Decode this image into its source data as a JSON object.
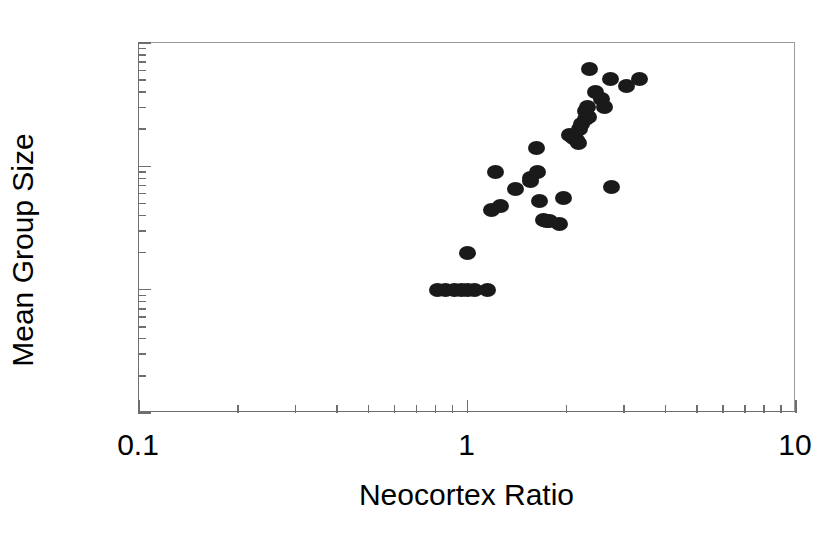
{
  "chart_data": {
    "type": "scatter",
    "title": "",
    "xlabel": "Neocortex Ratio",
    "ylabel": "Mean Group Size",
    "xscale": "log",
    "yscale": "log",
    "xlim": [
      0.1,
      10
    ],
    "ylim": [
      0.1,
      100
    ],
    "grid": false,
    "legend": null,
    "marker": {
      "shape": "circle",
      "color": "#1a1a1a",
      "filled": true
    },
    "xticks": [
      0.1,
      1,
      10
    ],
    "xtick_labels": [
      "0.1",
      "1",
      "10"
    ],
    "yticks": [
      0.1,
      1,
      10,
      100
    ],
    "ytick_labels": [
      "0.1",
      "1",
      "10",
      "100"
    ],
    "x": [
      0.81,
      0.86,
      0.91,
      0.96,
      1.0,
      1.05,
      1.15,
      1.0,
      1.22,
      1.26,
      1.18,
      1.4,
      1.55,
      1.66,
      1.7,
      1.74,
      1.78,
      1.9,
      1.56,
      1.62,
      1.96,
      1.63,
      2.1,
      2.14,
      2.18,
      2.2,
      2.22,
      2.05,
      2.28,
      2.34,
      2.28,
      2.32,
      2.35,
      2.45,
      2.55,
      2.62,
      2.75,
      3.05,
      3.35,
      2.72
    ],
    "y": [
      1.0,
      1.0,
      1.0,
      1.0,
      1.0,
      1.0,
      1.0,
      2.0,
      9.0,
      4.8,
      4.4,
      6.6,
      8.1,
      5.2,
      3.7,
      3.6,
      3.6,
      3.4,
      7.6,
      14.0,
      5.5,
      9.0,
      17.0,
      16.5,
      15.5,
      20.0,
      22.0,
      18.0,
      24.0,
      25.0,
      28.0,
      30.0,
      62.0,
      40.0,
      35.0,
      30.0,
      6.8,
      45.0,
      51.0,
      51.0
    ],
    "n_points": 40
  },
  "axes": {
    "x_title": "Neocortex Ratio",
    "y_title": "Mean Group Size",
    "x_tick_labels": [
      "0.1",
      "1",
      "10"
    ],
    "y_tick_labels": [
      "100",
      "10",
      "1",
      "0.1"
    ]
  },
  "style": {
    "marker_color": "#1a1a1a",
    "axis_color": "#6e6e6e",
    "background": "#ffffff"
  }
}
